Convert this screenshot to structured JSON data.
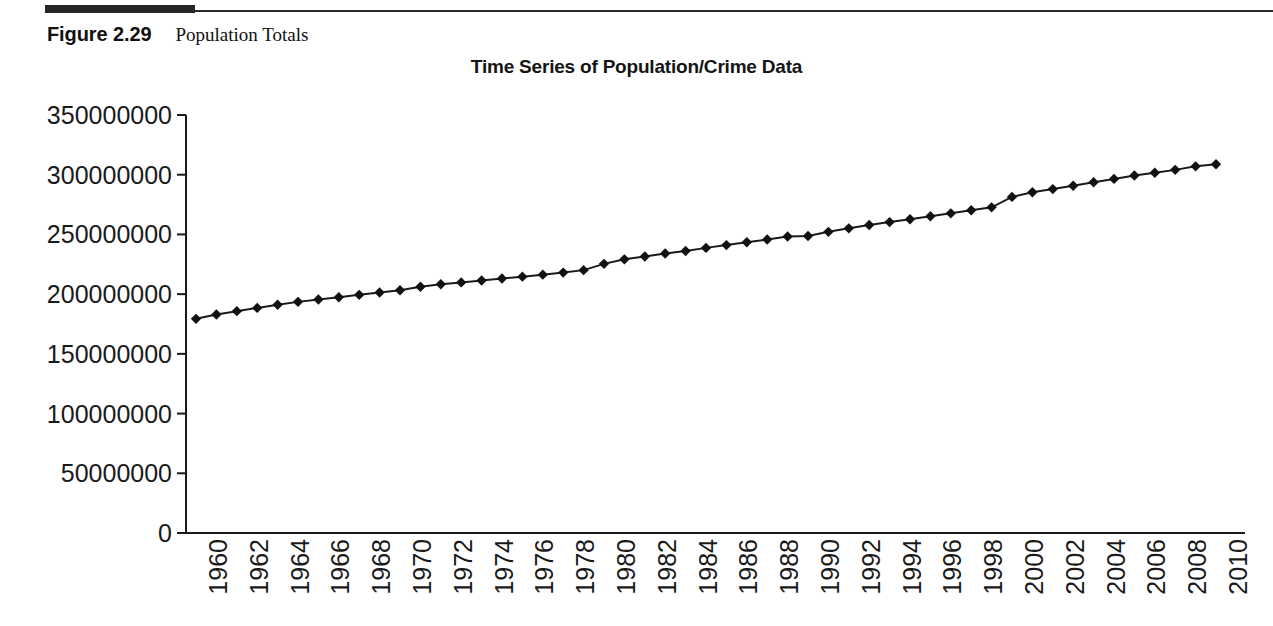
{
  "figure": {
    "number_label": "Figure 2.29",
    "caption": "Population Totals",
    "rule_color": "#262626"
  },
  "chart_data": {
    "type": "line",
    "title": "Time Series of Population/Crime Data",
    "xlabel": "",
    "ylabel": "",
    "grid": false,
    "legend": "none",
    "marker": "diamond",
    "line_color": "#1a1a1a",
    "marker_color": "#111111",
    "xlim": [
      1960,
      2010
    ],
    "ylim": [
      0,
      350000000
    ],
    "ytick_labels": [
      "350000000",
      "300000000",
      "250000000",
      "200000000",
      "150000000",
      "100000000",
      "50000000",
      "0"
    ],
    "ytick_values": [
      350000000,
      300000000,
      250000000,
      200000000,
      150000000,
      100000000,
      50000000,
      0
    ],
    "xtick_labels": [
      "1960",
      "1962",
      "1964",
      "1966",
      "1968",
      "1970",
      "1972",
      "1974",
      "1976",
      "1978",
      "1980",
      "1982",
      "1984",
      "1986",
      "1988",
      "1990",
      "1992",
      "1994",
      "1996",
      "1998",
      "2000",
      "2002",
      "2004",
      "2006",
      "2008",
      "2010"
    ],
    "series": [
      {
        "name": "Population",
        "x": [
          1960,
          1961,
          1962,
          1963,
          1964,
          1965,
          1966,
          1967,
          1968,
          1969,
          1970,
          1971,
          1972,
          1973,
          1974,
          1975,
          1976,
          1977,
          1978,
          1979,
          1980,
          1981,
          1982,
          1983,
          1984,
          1985,
          1986,
          1987,
          1988,
          1989,
          1990,
          1991,
          1992,
          1993,
          1994,
          1995,
          1996,
          1997,
          1998,
          1999,
          2000,
          2001,
          2002,
          2003,
          2004,
          2005,
          2006,
          2007,
          2008,
          2009,
          2010
        ],
        "values": [
          179323175,
          182992000,
          185771000,
          188483000,
          191141000,
          193526000,
          195576000,
          197457000,
          199399000,
          201385000,
          203235298,
          206212000,
          208230000,
          209851000,
          211392000,
          213124000,
          214659000,
          216332000,
          218059000,
          220099000,
          225349264,
          229146000,
          231534000,
          233981000,
          236158000,
          238740000,
          241077000,
          243400000,
          245807000,
          248239000,
          248709873,
          252177000,
          255082000,
          257908000,
          260341000,
          262755000,
          265284000,
          267637000,
          270296000,
          272691000,
          281421906,
          285318000,
          287973000,
          290788976,
          293656842,
          296507061,
          299398484,
          301621157,
          304059724,
          307006550,
          308745538
        ]
      }
    ]
  }
}
